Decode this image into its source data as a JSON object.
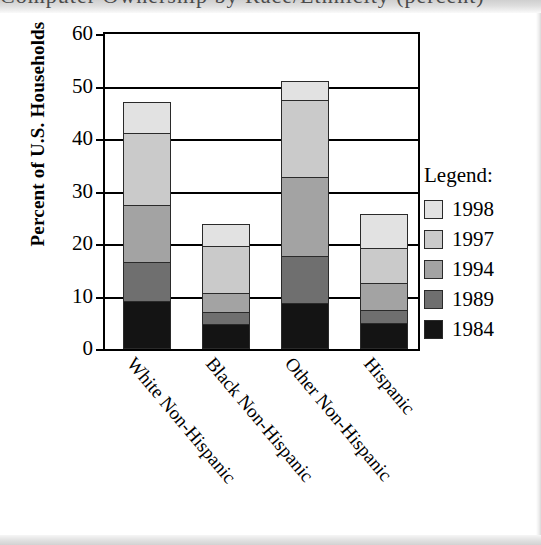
{
  "chart_data": {
    "type": "bar",
    "subtype": "stacked-bar",
    "title": "",
    "xlabel": "",
    "ylabel": "Percent of U.S. Households",
    "ylim": [
      0,
      60
    ],
    "ytick_values": [
      0,
      10,
      20,
      30,
      40,
      50,
      60
    ],
    "ytick_labels": [
      "0",
      "10",
      "20",
      "30",
      "40",
      "50",
      "60"
    ],
    "grid": true,
    "grid_axis": "y",
    "legend_position": "right",
    "legend_title": "Legend:",
    "categories": [
      "White Non-Hispanic",
      "Black Non-Hispanic",
      "Other Non-Hispanic",
      "Hispanic"
    ],
    "series": [
      {
        "name": "1984",
        "color": "#141414",
        "values": [
          9.0,
          4.5,
          8.6,
          4.7
        ]
      },
      {
        "name": "1989",
        "color": "#6f6f6f",
        "values": [
          7.3,
          2.3,
          9.0,
          2.6
        ]
      },
      {
        "name": "1994",
        "color": "#a3a3a3",
        "values": [
          10.9,
          3.6,
          14.9,
          5.0
        ]
      },
      {
        "name": "1997",
        "color": "#cacaca",
        "values": [
          13.8,
          9.1,
          14.7,
          6.7
        ]
      },
      {
        "name": "1998",
        "color": "#e2e2e2",
        "values": [
          5.7,
          4.0,
          3.6,
          6.5
        ]
      }
    ],
    "stack_tops": {
      "White Non-Hispanic": [
        9.0,
        16.3,
        27.2,
        41.0,
        46.7
      ],
      "Black Non-Hispanic": [
        4.5,
        6.8,
        10.4,
        19.5,
        23.5
      ],
      "Other Non-Hispanic": [
        8.6,
        17.6,
        32.5,
        47.2,
        50.8
      ],
      "Hispanic": [
        4.7,
        7.3,
        12.3,
        19.0,
        25.5
      ]
    },
    "totals": [
      46.7,
      23.5,
      50.8,
      25.5
    ],
    "legend_order": [
      "1998",
      "1997",
      "1994",
      "1989",
      "1984"
    ]
  },
  "page": {
    "top_strip_ghost_text": "Computer Ownership by Race/Ethnicity (percent)"
  }
}
